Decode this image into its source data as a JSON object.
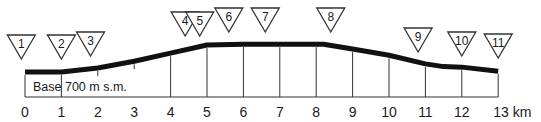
{
  "diagram": {
    "type": "elevation-profile",
    "base_label": "Base 700 m s.m.",
    "unit": "km",
    "colors": {
      "profile": "#111111",
      "lines": "#333333",
      "text": "#1a1a1a",
      "background": "#ffffff"
    },
    "axis": {
      "min": 0,
      "max": 13,
      "ticks": [
        "0",
        "1",
        "2",
        "3",
        "4",
        "5",
        "6",
        "7",
        "8",
        "9",
        "10",
        "11",
        "12",
        "13"
      ],
      "last_tick_label": "13 km"
    },
    "profile_points_km_rel": [
      [
        0,
        0
      ],
      [
        1,
        0
      ],
      [
        2,
        0.15
      ],
      [
        3,
        0.4
      ],
      [
        4,
        0.7
      ],
      [
        5,
        1.0
      ],
      [
        6,
        1.03
      ],
      [
        7,
        1.03
      ],
      [
        8.2,
        1.03
      ],
      [
        9,
        0.85
      ],
      [
        10,
        0.62
      ],
      [
        11,
        0.3
      ],
      [
        11.5,
        0.2
      ],
      [
        12,
        0.18
      ],
      [
        13,
        0.03
      ]
    ],
    "markers": [
      {
        "label": "1",
        "km": -0.1,
        "y": 47
      },
      {
        "label": "2",
        "km": 1.0,
        "y": 47
      },
      {
        "label": "3",
        "km": 1.8,
        "y": 44
      },
      {
        "label": "4",
        "km": 4.4,
        "y": 24
      },
      {
        "label": "5",
        "km": 4.8,
        "y": 24
      },
      {
        "label": "6",
        "km": 5.6,
        "y": 20
      },
      {
        "label": "7",
        "km": 6.6,
        "y": 20
      },
      {
        "label": "8",
        "km": 8.4,
        "y": 20
      },
      {
        "label": "9",
        "km": 10.8,
        "y": 40
      },
      {
        "label": "10",
        "km": 12.0,
        "y": 44
      },
      {
        "label": "11",
        "km": 13.0,
        "y": 46
      }
    ]
  }
}
